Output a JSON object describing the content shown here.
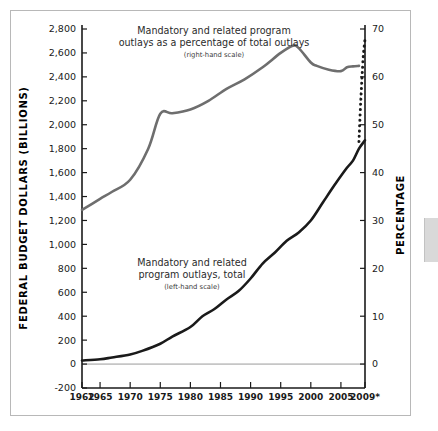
{
  "figure": {
    "frame_color": "#b8b8b8",
    "background": "#ffffff"
  },
  "chart_data": {
    "type": "line",
    "title": "",
    "subtitle": "",
    "xlabel": "",
    "ylabel": "FEDERAL BUDGET DOLLARS (BILLIONS)",
    "y2label": "PERCENTAGE",
    "xlim": [
      1962,
      2009
    ],
    "ylim": [
      -200,
      2800
    ],
    "y2lim": [
      -5,
      70
    ],
    "grid": false,
    "legend_position": "inline-annotations",
    "x_tick_labels": [
      "1962",
      "1965",
      "1970",
      "1975",
      "1980",
      "1985",
      "1990",
      "1995",
      "2000",
      "2005",
      "2009*"
    ],
    "x_tick_values": [
      1962,
      1965,
      1970,
      1975,
      1980,
      1985,
      1990,
      1995,
      2000,
      2005,
      2009
    ],
    "y_tick_labels": [
      "2,800",
      "2,600",
      "2,400",
      "2,200",
      "2,000",
      "1,800",
      "1,600",
      "1,400",
      "1,200",
      "1,000",
      "800",
      "600",
      "400",
      "200",
      "0",
      "-200"
    ],
    "y_tick_values": [
      2800,
      2600,
      2400,
      2200,
      2000,
      1800,
      1600,
      1400,
      1200,
      1000,
      800,
      600,
      400,
      200,
      0,
      -200
    ],
    "y2_tick_labels": [
      "70",
      "60",
      "50",
      "40",
      "30",
      "20",
      "10",
      "0"
    ],
    "y2_tick_values": [
      70,
      60,
      50,
      40,
      30,
      20,
      10,
      0
    ],
    "zero_line": 0,
    "series": [
      {
        "name": "Mandatory and related program outlays, total",
        "axis": "left",
        "color": "#1a1a1a",
        "style": "solid",
        "width": 2.6,
        "x": [
          1962,
          1965,
          1967,
          1970,
          1972,
          1975,
          1977,
          1980,
          1982,
          1984,
          1986,
          1988,
          1990,
          1992,
          1994,
          1996,
          1998,
          2000,
          2002,
          2004,
          2006,
          2007,
          2008,
          2009
        ],
        "values": [
          30,
          40,
          55,
          80,
          110,
          170,
          230,
          310,
          400,
          460,
          540,
          610,
          715,
          840,
          930,
          1030,
          1100,
          1200,
          1350,
          1500,
          1640,
          1700,
          1800,
          1870
        ]
      },
      {
        "name": "Mandatory and related program outlays as a percentage of total outlays",
        "axis": "right",
        "color": "#6e6e6e",
        "style": "solid",
        "width": 2.6,
        "x": [
          1962,
          1965,
          1967,
          1970,
          1973,
          1975,
          1977,
          1980,
          1983,
          1986,
          1989,
          1992,
          1995,
          1997,
          1998,
          2000,
          2001,
          2003,
          2005,
          2006,
          2007,
          2008
        ],
        "values": [
          32.2,
          34.5,
          36.0,
          38.5,
          45.0,
          52.3,
          52.4,
          53.2,
          55.0,
          57.5,
          59.5,
          62.0,
          65.0,
          66.5,
          66.0,
          63.0,
          62.3,
          61.5,
          61.2,
          62.0,
          62.2,
          62.3
        ]
      },
      {
        "name": "Mandatory and related program outlays as a percentage of total outlays (projected)",
        "axis": "right",
        "color": "#1a1a1a",
        "style": "dotted",
        "width": 3.0,
        "x": [
          2008,
          2008.3,
          2008.7,
          2009
        ],
        "values": [
          46.5,
          55.0,
          64.0,
          67.8
        ]
      }
    ],
    "annotations": [
      {
        "name": "percentage-series-annotation",
        "lines": [
          "Mandatory and related program",
          "outlays as a percentage of total outlays"
        ],
        "sub": "(right-hand scale)",
        "x_px": 214,
        "y_px": 34
      },
      {
        "name": "total-series-annotation",
        "lines": [
          "Mandatory and related",
          "program outlays, total"
        ],
        "sub": "(left-hand scale)",
        "x_px": 192,
        "y_px": 266
      }
    ]
  }
}
